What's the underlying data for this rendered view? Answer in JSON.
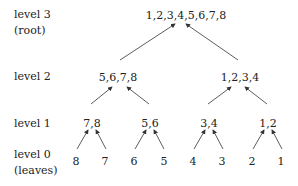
{
  "levels": [
    {
      "label": "level 3",
      "sub": "(root)"
    },
    {
      "label": "level 2",
      "sub": ""
    },
    {
      "label": "level 1",
      "sub": ""
    },
    {
      "label": "level 0",
      "sub": "(leaves)"
    }
  ],
  "tree": {
    "root": "1,2,3,4,5,6,7,8",
    "level2": [
      "5,6,7,8",
      "1,2,3,4"
    ],
    "level1": [
      "7,8",
      "5,6",
      "3,4",
      "1,2"
    ],
    "level0": [
      "8",
      "7",
      "6",
      "5",
      "4",
      "3",
      "2",
      "1"
    ]
  },
  "colors": {
    "edge": "#333333",
    "text": "#222222"
  }
}
